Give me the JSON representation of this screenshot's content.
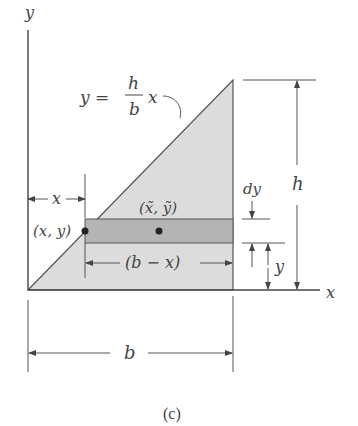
{
  "figure": {
    "caption": "(c)",
    "colors": {
      "triangle_fill": "#dcdcdc",
      "strip_fill": "#b4b4b4",
      "line": "#555555",
      "text": "#444444",
      "dot": "#222222"
    },
    "labels": {
      "y_axis": "y",
      "x_axis": "x",
      "equation_lhs": "y =",
      "equation_num": "h",
      "equation_den": "b",
      "equation_rhs": "x",
      "x_dim": "x",
      "point_xy": "(x, y)",
      "centroid": "(x̃, ỹ)",
      "strip_width": "(b − x)",
      "dy": "dy",
      "h": "h",
      "y_dim": "y",
      "b": "b"
    }
  }
}
